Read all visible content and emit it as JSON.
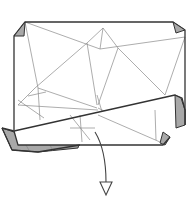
{
  "diagram": {
    "type": "origami-step",
    "colors": {
      "paper": "#ffffff",
      "paper_back": "#a8a8a8",
      "edge": "#333333",
      "crease": "#8a8a8a"
    },
    "elements": {
      "sheet": "paper-sheet",
      "top_left_corner": "folded-corner",
      "top_right_corner": "folded-corner",
      "bottom_flap": "folded-flap",
      "arrow": "fold-down-arrow"
    }
  }
}
